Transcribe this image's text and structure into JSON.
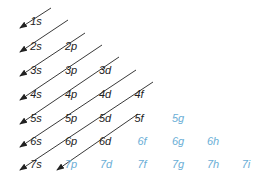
{
  "diagram": {
    "colors": {
      "filled": "#222222",
      "unfilled": "#6aaed6",
      "arrow": "#222222"
    },
    "rows": [
      {
        "n": 1,
        "y": 21,
        "orbitals": [
          {
            "label": "1s",
            "x": 36,
            "state": "filled"
          }
        ]
      },
      {
        "n": 2,
        "y": 46,
        "orbitals": [
          {
            "label": "2s",
            "x": 36,
            "state": "filled"
          },
          {
            "label": "2p",
            "x": 71,
            "state": "filled"
          }
        ]
      },
      {
        "n": 3,
        "y": 70,
        "orbitals": [
          {
            "label": "3s",
            "x": 36,
            "state": "filled"
          },
          {
            "label": "3p",
            "x": 71,
            "state": "filled"
          },
          {
            "label": "3d",
            "x": 105,
            "state": "filled"
          }
        ]
      },
      {
        "n": 4,
        "y": 94,
        "orbitals": [
          {
            "label": "4s",
            "x": 36,
            "state": "filled"
          },
          {
            "label": "4p",
            "x": 71,
            "state": "filled"
          },
          {
            "label": "4d",
            "x": 105,
            "state": "filled"
          },
          {
            "label": "4f",
            "x": 139,
            "state": "filled"
          }
        ]
      },
      {
        "n": 5,
        "y": 118,
        "orbitals": [
          {
            "label": "5s",
            "x": 36,
            "state": "filled"
          },
          {
            "label": "5p",
            "x": 71,
            "state": "filled"
          },
          {
            "label": "5d",
            "x": 105,
            "state": "filled"
          },
          {
            "label": "5f",
            "x": 139,
            "state": "filled"
          },
          {
            "label": "5g",
            "x": 178,
            "state": "unfilled"
          }
        ]
      },
      {
        "n": 6,
        "y": 141,
        "orbitals": [
          {
            "label": "6s",
            "x": 36,
            "state": "filled"
          },
          {
            "label": "6p",
            "x": 71,
            "state": "filled"
          },
          {
            "label": "6d",
            "x": 105,
            "state": "filled"
          },
          {
            "label": "6f",
            "x": 142,
            "state": "unfilled"
          },
          {
            "label": "6g",
            "x": 178,
            "state": "unfilled"
          },
          {
            "label": "6h",
            "x": 213,
            "state": "unfilled"
          }
        ]
      },
      {
        "n": 7,
        "y": 164,
        "orbitals": [
          {
            "label": "7s",
            "x": 36,
            "state": "filled"
          },
          {
            "label": "7p",
            "x": 71,
            "state": "unfilled"
          },
          {
            "label": "7d",
            "x": 106,
            "state": "unfilled"
          },
          {
            "label": "7f",
            "x": 142,
            "state": "unfilled"
          },
          {
            "label": "7g",
            "x": 178,
            "state": "unfilled"
          },
          {
            "label": "7h",
            "x": 213,
            "state": "unfilled"
          },
          {
            "label": "7i",
            "x": 246,
            "state": "unfilled"
          }
        ]
      }
    ],
    "arrows": [
      {
        "id": "arrow-1s",
        "x1": 51,
        "y1": 8,
        "x2": 20,
        "y2": 28
      },
      {
        "id": "arrow-2s",
        "x1": 68,
        "y1": 20,
        "x2": 20,
        "y2": 52
      },
      {
        "id": "arrow-3s",
        "x1": 85,
        "y1": 33,
        "x2": 20,
        "y2": 76
      },
      {
        "id": "arrow-4s",
        "x1": 102,
        "y1": 45,
        "x2": 20,
        "y2": 100
      },
      {
        "id": "arrow-5s",
        "x1": 119,
        "y1": 57,
        "x2": 20,
        "y2": 124
      },
      {
        "id": "arrow-6s",
        "x1": 136,
        "y1": 70,
        "x2": 20,
        "y2": 147
      },
      {
        "id": "arrow-7s",
        "x1": 153,
        "y1": 82,
        "x2": 20,
        "y2": 170
      },
      {
        "id": "arrow-7p",
        "x1": 138,
        "y1": 114,
        "x2": 57,
        "y2": 170
      }
    ]
  }
}
